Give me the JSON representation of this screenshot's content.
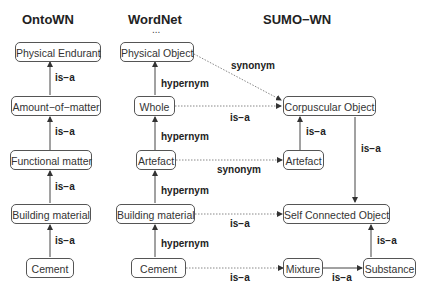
{
  "columns": {
    "ontown": "OntoWN",
    "wordnet": "WordNet",
    "sumo": "SUMO−WN",
    "wordnet_ellipsis": "..."
  },
  "nodes": {
    "onto_physical_endurant": "Physical Endurant",
    "onto_amount_of_matter": "Amount−of−matter",
    "onto_functional_matter": "Functional matter",
    "onto_building_material": "Building material",
    "onto_cement": "Cement",
    "wn_physical_object": "Physical Object",
    "wn_whole": "Whole",
    "wn_artefact": "Artefact",
    "wn_building_material": "Building material",
    "wn_cement": "Cement",
    "sumo_corpuscular_object": "Corpuscular Object",
    "sumo_artefact": "Artefact",
    "sumo_self_connected_object": "Self Connected Object",
    "sumo_mixture": "Mixture",
    "sumo_substance": "Substance"
  },
  "edge_labels": {
    "onto_1": "is−a",
    "onto_2": "is−a",
    "onto_3": "is−a",
    "onto_4": "is−a",
    "wn_1": "hypernym",
    "wn_2": "hypernym",
    "wn_3": "hypernym",
    "wn_4": "hypernym",
    "map_physical_object": "synonym",
    "map_whole": "is−a",
    "map_artefact": "synonym",
    "map_building_material": "is−a",
    "map_cement": "is−a",
    "sumo_artefact_corpuscular": "is−a",
    "sumo_corpuscular_selfconnected": "is−a",
    "sumo_substance_selfconnected": "is−a",
    "sumo_mixture_substance": "is−a"
  },
  "colors": {
    "line": "#444444",
    "dotted": "#888888",
    "node_border": "#555555"
  }
}
